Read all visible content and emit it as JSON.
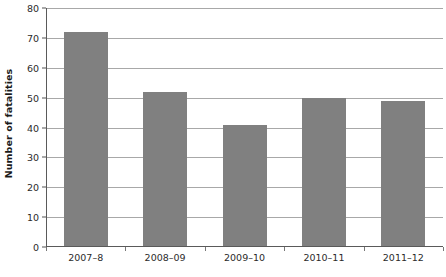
{
  "chart_data": {
    "type": "bar",
    "title": "",
    "subtitle": "",
    "xlabel": "",
    "ylabel": "Number of fatalities",
    "categories": [
      "2007–8",
      "2008–09",
      "2009–10",
      "2010–11",
      "2011–12"
    ],
    "values": [
      72,
      52,
      41,
      50,
      49
    ],
    "ylim": [
      0,
      80
    ],
    "ytick_step": 10,
    "yticks": [
      0,
      10,
      20,
      30,
      40,
      50,
      60,
      70,
      80
    ],
    "ytick_labels": [
      "0",
      "10",
      "20",
      "30",
      "40",
      "50",
      "60",
      "70",
      "80"
    ],
    "grid": "horizontal",
    "legend": "none",
    "series": [
      {
        "name": "Number of fatalities",
        "values": [
          72,
          52,
          41,
          50,
          49
        ],
        "color": "#808080"
      }
    ],
    "colors": {
      "bar_fill": "#808080",
      "gridline": "#a8a8a8",
      "axis_line": "#5a5a5a",
      "tick_label": "#2b2b2b",
      "axis_title": "#1a1a1a",
      "background": "#ffffff"
    }
  }
}
